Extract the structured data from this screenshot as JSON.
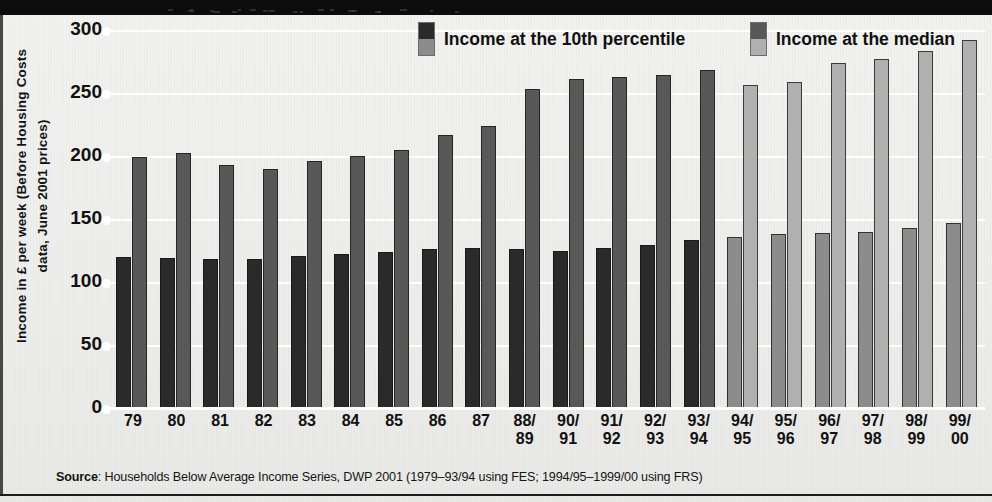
{
  "chart_data": {
    "type": "bar",
    "title": "",
    "xlabel": "",
    "ylabel": "Income in £ per week (Before Housing Costs data, June 2001 prices)",
    "ylim": [
      0,
      300
    ],
    "yticks": [
      0,
      50,
      100,
      150,
      200,
      250,
      300
    ],
    "grid": true,
    "legend_position": "top",
    "categories": [
      "79",
      "80",
      "81",
      "82",
      "83",
      "84",
      "85",
      "86",
      "87",
      "88/89",
      "90/91",
      "91/92",
      "92/93",
      "93/94",
      "94/95",
      "95/96",
      "96/97",
      "97/98",
      "98/99",
      "99/00"
    ],
    "category_lines": [
      {
        "l1": "79",
        "l2": ""
      },
      {
        "l1": "80",
        "l2": ""
      },
      {
        "l1": "81",
        "l2": ""
      },
      {
        "l1": "82",
        "l2": ""
      },
      {
        "l1": "83",
        "l2": ""
      },
      {
        "l1": "84",
        "l2": ""
      },
      {
        "l1": "85",
        "l2": ""
      },
      {
        "l1": "86",
        "l2": ""
      },
      {
        "l1": "87",
        "l2": ""
      },
      {
        "l1": "88/",
        "l2": "89"
      },
      {
        "l1": "90/",
        "l2": "91"
      },
      {
        "l1": "91/",
        "l2": "92"
      },
      {
        "l1": "92/",
        "l2": "93"
      },
      {
        "l1": "93/",
        "l2": "94"
      },
      {
        "l1": "94/",
        "l2": "95"
      },
      {
        "l1": "95/",
        "l2": "96"
      },
      {
        "l1": "96/",
        "l2": "97"
      },
      {
        "l1": "97/",
        "l2": "98"
      },
      {
        "l1": "98/",
        "l2": "99"
      },
      {
        "l1": "99/",
        "l2": "00"
      }
    ],
    "series": [
      {
        "name": "Income at the 10th percentile",
        "values": [
          120,
          119,
          118,
          118,
          121,
          122,
          124,
          126,
          127,
          126,
          125,
          127,
          129,
          133,
          136,
          138,
          139,
          140,
          143,
          147
        ]
      },
      {
        "name": "Income at the median",
        "values": [
          199,
          202,
          193,
          190,
          196,
          200,
          205,
          217,
          224,
          253,
          261,
          263,
          264,
          268,
          256,
          259,
          274,
          277,
          283,
          292
        ]
      }
    ],
    "survey_split_index": 14,
    "colors": {
      "p10_fes": "#2a2a2a",
      "med_fes": "#585858",
      "p10_frs": "#8c8c8c",
      "med_frs": "#b0b0b0",
      "grid": "#ffffff",
      "background": "#efefed",
      "text": "#111111"
    }
  },
  "legend": {
    "items": [
      {
        "label": "Income at the 10th percentile",
        "swatch_top": "#2a2a2a",
        "swatch_bottom": "#8c8c8c"
      },
      {
        "label": "Income at the median",
        "swatch_top": "#585858",
        "swatch_bottom": "#b0b0b0"
      }
    ]
  },
  "source": {
    "prefix": "Source",
    "text": ": Households Below Average Income Series, DWP 2001 (1979–93/94 using FES; 1994/95–1999/00 using FRS)"
  }
}
